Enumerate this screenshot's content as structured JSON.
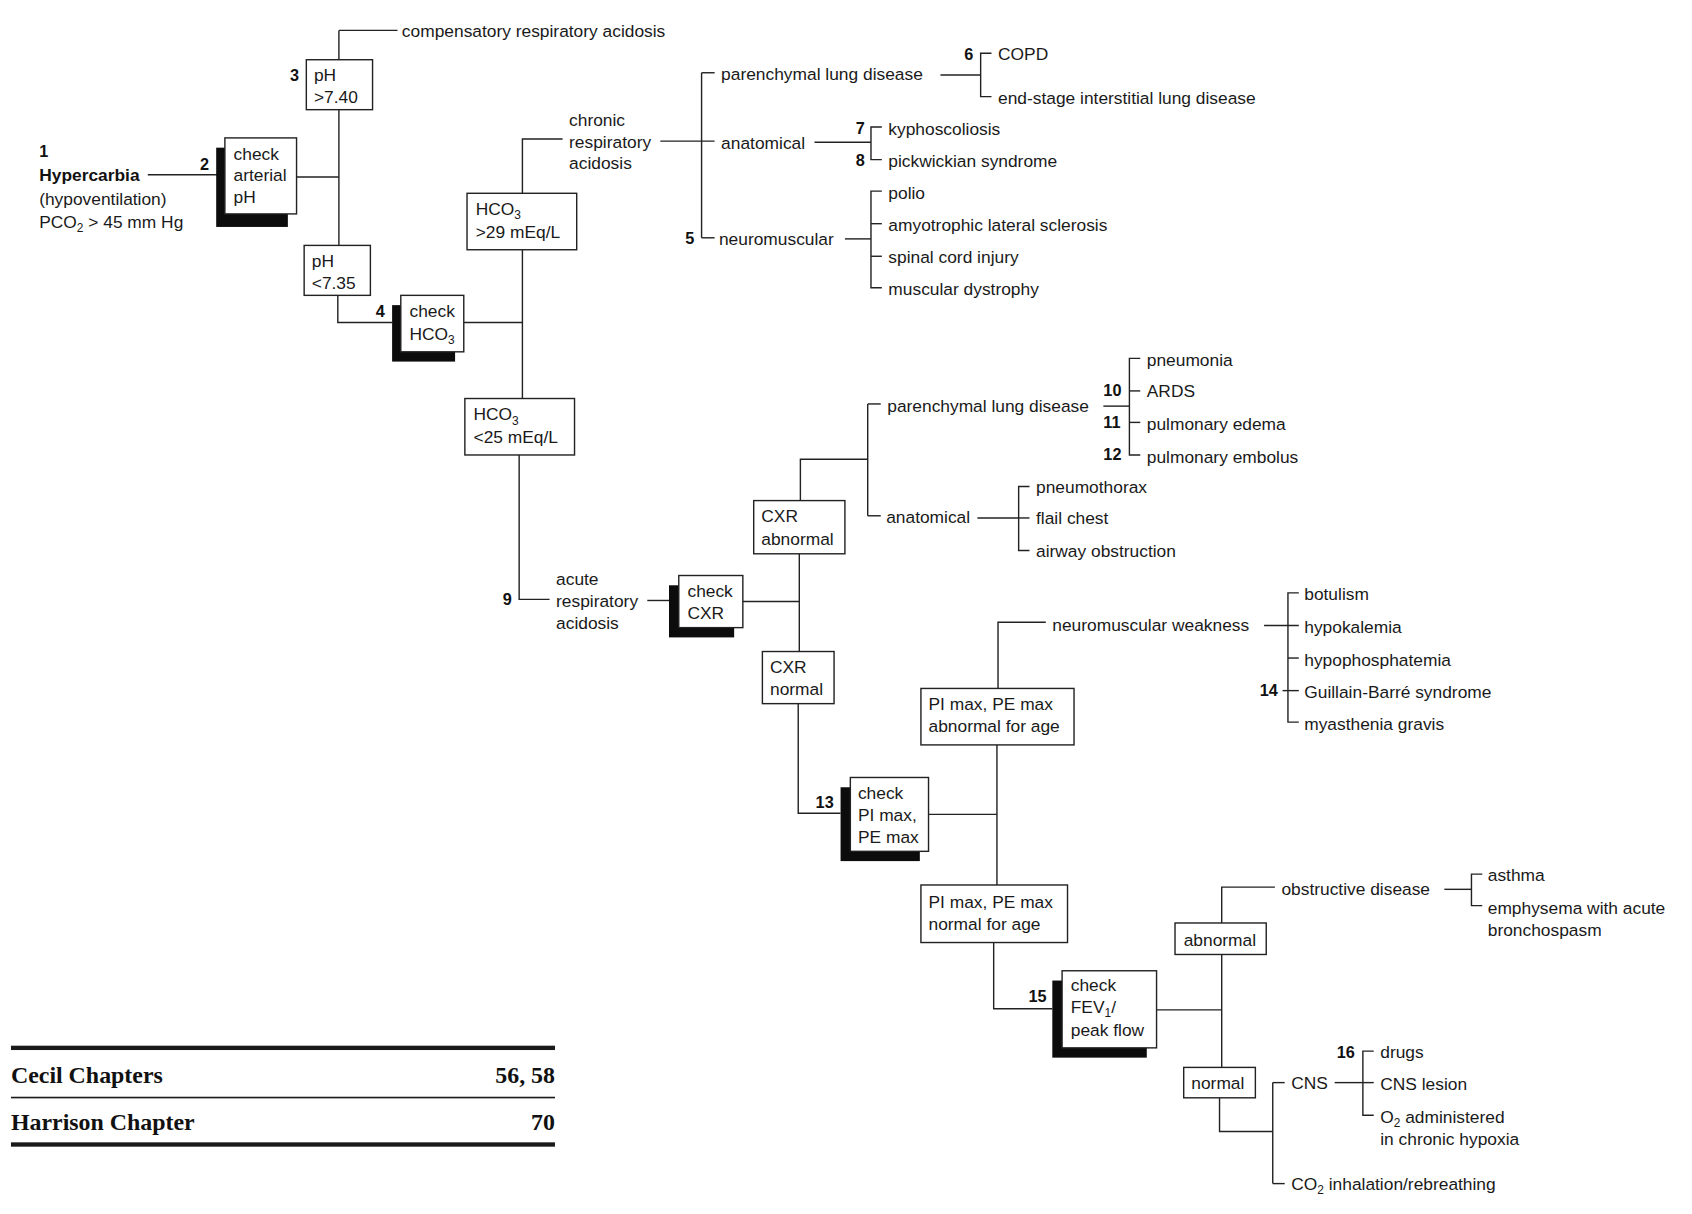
{
  "start": {
    "num": "1",
    "title": "Hypercarbia",
    "line2": "(hypoventilation)",
    "line3a": "PCO",
    "line3sub": "2",
    "line3b": " > 45 mm Hg"
  },
  "nodes": {
    "check_ph": {
      "num": "2",
      "l1": "check",
      "l2": "arterial",
      "l3": "pH"
    },
    "ph_high": {
      "num": "3",
      "l1": "pH",
      "l2": ">7.40"
    },
    "comp_resp": "compensatory respiratory acidosis",
    "ph_low": {
      "l1": "pH",
      "l2": "<7.35"
    },
    "check_hco3": {
      "num": "4",
      "l1": "check",
      "l2a": "HCO",
      "l2sub": "3"
    },
    "hco3_high": {
      "l1a": "HCO",
      "l1sub": "3",
      "l2": ">29 mEq/L"
    },
    "hco3_low": {
      "l1a": "HCO",
      "l1sub": "3",
      "l2": "<25 mEq/L"
    },
    "chronic": {
      "l1": "chronic",
      "l2": "respiratory",
      "l3": "acidosis"
    },
    "chronic_branches": {
      "parenchymal": {
        "label": "parenchymal lung disease",
        "num": "6",
        "items": [
          "COPD",
          "end-stage interstitial lung disease"
        ]
      },
      "anatomical": {
        "label": "anatomical",
        "nums": [
          "7",
          "8"
        ],
        "items": [
          "kyphoscoliosis",
          "pickwickian syndrome"
        ]
      },
      "neuromuscular": {
        "label": "neuromuscular",
        "num": "5",
        "items": [
          "polio",
          "amyotrophic lateral sclerosis",
          "spinal cord injury",
          "muscular dystrophy"
        ]
      }
    },
    "acute": {
      "num": "9",
      "l1": "acute",
      "l2": "respiratory",
      "l3": "acidosis"
    },
    "check_cxr": {
      "l1": "check",
      "l2": "CXR"
    },
    "cxr_abnormal": {
      "l1": "CXR",
      "l2": "abnormal"
    },
    "cxr_normal": {
      "l1": "CXR",
      "l2": "normal"
    },
    "acute_branches": {
      "parenchymal": {
        "label": "parenchymal lung disease",
        "nums": [
          "10",
          "11",
          "12"
        ],
        "items": [
          "pneumonia",
          "ARDS",
          "pulmonary edema",
          "pulmonary embolus"
        ]
      },
      "anatomical": {
        "label": "anatomical",
        "items": [
          "pneumothorax",
          "flail chest",
          "airway obstruction"
        ]
      }
    },
    "check_pimax": {
      "num": "13",
      "l1": "check",
      "l2": "PI max,",
      "l3": "PE max"
    },
    "pimax_abnormal": {
      "l1": "PI max, PE max",
      "l2": "abnormal for age"
    },
    "pimax_normal": {
      "l1": "PI max, PE max",
      "l2": "normal for age"
    },
    "nm_weakness": {
      "label": "neuromuscular weakness",
      "num": "14",
      "items": [
        "botulism",
        "hypokalemia",
        "hypophosphatemia",
        "Guillain-Barré syndrome",
        "myasthenia gravis"
      ]
    },
    "check_fev": {
      "num": "15",
      "l1": "check",
      "l2a": "FEV",
      "l2sub": "1",
      "l2b": "/",
      "l3": "peak flow"
    },
    "fev_abnormal": "abnormal",
    "fev_normal": "normal",
    "obstructive": {
      "label": "obstructive disease",
      "items": [
        "asthma",
        "emphysema with acute",
        "bronchospasm"
      ]
    },
    "cns": {
      "label": "CNS",
      "num": "16",
      "items": [
        "drugs",
        "CNS lesion"
      ],
      "o2a": "O",
      "o2sub": "2",
      "o2b": " administered",
      "o2l2": "in chronic hypoxia"
    },
    "co2": {
      "a": "CO",
      "sub": "2",
      "b": " inhalation/rebreathing"
    }
  },
  "references": [
    {
      "label": "Cecil Chapters",
      "value": "56, 58"
    },
    {
      "label": "Harrison Chapter",
      "value": "70"
    }
  ]
}
